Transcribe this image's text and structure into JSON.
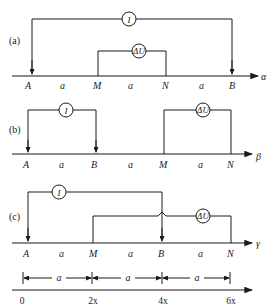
{
  "panels": {
    "a": {
      "label": "(a)",
      "axis_label": "α",
      "electrodes": [
        "A",
        "M",
        "N",
        "B"
      ],
      "spacings": [
        "a",
        "a",
        "a"
      ],
      "current_meter": "I",
      "voltage_meter": "ΔU"
    },
    "b": {
      "label": "(b)",
      "axis_label": "β",
      "electrodes": [
        "A",
        "B",
        "M",
        "N"
      ],
      "spacings": [
        "a",
        "a",
        "a"
      ],
      "current_meter": "I",
      "voltage_meter": "ΔU"
    },
    "c": {
      "label": "(c)",
      "axis_label": "γ",
      "electrodes": [
        "A",
        "M",
        "B",
        "N"
      ],
      "spacings": [
        "a",
        "a",
        "a"
      ],
      "current_meter": "I",
      "voltage_meter": "ΔU"
    }
  },
  "scale": {
    "intervals": [
      "a",
      "a",
      "a"
    ],
    "ticks": [
      "0",
      "2x",
      "4x",
      "6x"
    ]
  },
  "colors": {
    "ink": "#1a1a1a",
    "background": "#ffffff"
  }
}
